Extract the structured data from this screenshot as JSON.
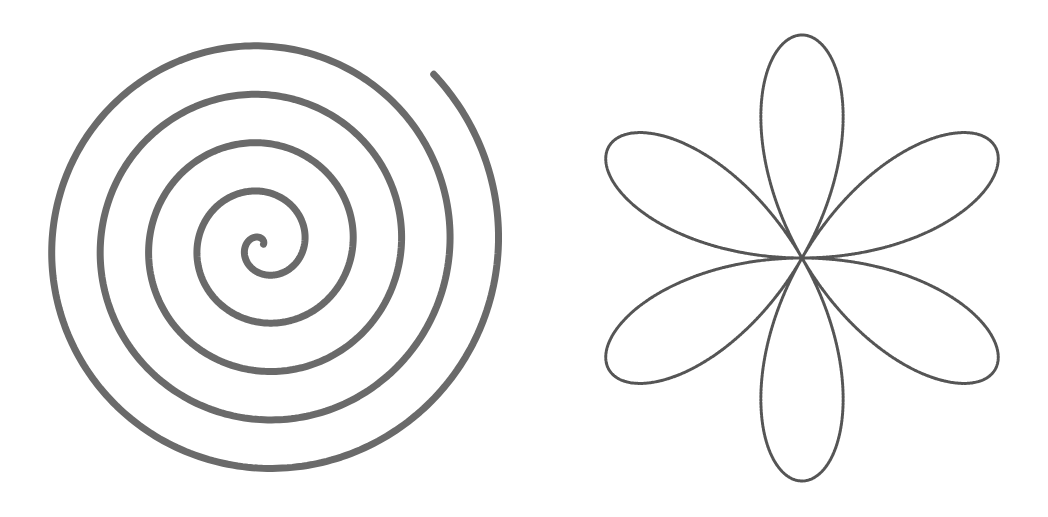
{
  "figures": [
    {
      "id": "spiral",
      "name": "Archimedean spiral",
      "type": "archimedean-spiral",
      "center": [
        263,
        245
      ],
      "r_offset": 5,
      "growth_per_radian": 7.72,
      "theta_start_deg": 60,
      "theta_end_deg": 1845,
      "theta_ref_deg": 90,
      "turns": 5,
      "stroke": "#6a6a6a",
      "stroke_width": 7
    },
    {
      "id": "rose",
      "name": "Six-petal rose curve",
      "type": "rose-curve",
      "center": [
        802,
        258
      ],
      "radius": 223,
      "k": 3,
      "petals": 6,
      "petal_angles_deg": [
        30,
        90,
        150,
        210,
        270,
        330
      ],
      "stroke": "#555555",
      "stroke_width": 3
    }
  ]
}
